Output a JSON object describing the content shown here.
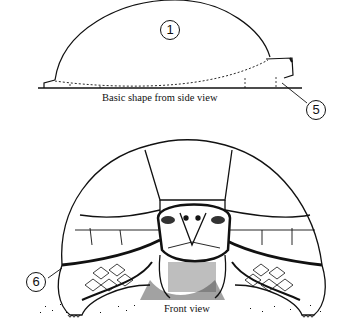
{
  "figure": {
    "side_view": {
      "caption": "Basic shape from side view",
      "callouts": [
        {
          "id": "1",
          "label": "1"
        },
        {
          "id": "5",
          "label": "5"
        }
      ]
    },
    "front_view": {
      "caption": "Front view",
      "callouts": [
        {
          "id": "6",
          "label": "6"
        }
      ]
    }
  }
}
